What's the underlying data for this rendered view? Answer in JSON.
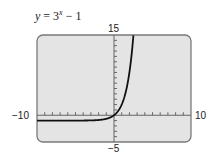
{
  "title": {
    "y_var": "y",
    "eq": " = 3",
    "exp": "x",
    "rest": " − 1"
  },
  "labels": {
    "xmin": "−10",
    "xmax": "10",
    "ymin": "−5",
    "ymax": "15"
  },
  "colors": {
    "screen": "#e4e4e4",
    "frame": "#7a7a7a",
    "curve": "#111111",
    "axis": "#666666"
  },
  "chart_data": {
    "type": "line",
    "xlabel": "",
    "ylabel": "",
    "xlim": [
      -10,
      10
    ],
    "ylim": [
      -5,
      15
    ],
    "x_tick_step": 1,
    "y_tick_step": 1,
    "grid": false,
    "series": [
      {
        "name": "y = 3^x − 1",
        "x": [
          -10,
          -5,
          -3,
          -2,
          -1,
          0,
          1,
          2,
          2.5
        ],
        "values": [
          -1.0,
          -0.996,
          -0.963,
          -0.889,
          -0.667,
          0,
          2,
          8,
          14.59
        ]
      }
    ],
    "corner_labels": {
      "x_min": "−10",
      "x_max": "10",
      "y_min": "−5",
      "y_max": "15"
    }
  }
}
